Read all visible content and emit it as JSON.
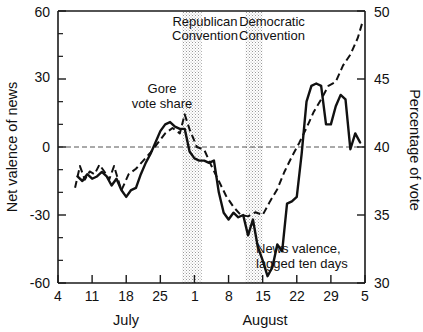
{
  "chart_data": {
    "type": "line",
    "title": "",
    "xlabel": "",
    "ylabel": "Net valence of news",
    "y2label": "Percentage of vote",
    "ylim": [
      -60,
      60
    ],
    "y2lim": [
      30,
      50
    ],
    "grid": false,
    "legend_position": "inline-annotations",
    "x_axis": {
      "tick_labels": [
        "4",
        "11",
        "18",
        "25",
        "1",
        "8",
        "15",
        "22",
        "29",
        "5"
      ],
      "month_labels": [
        "July",
        "August"
      ],
      "range_days": [
        0,
        63
      ],
      "tick_days": [
        0,
        7,
        14,
        21,
        28,
        35,
        42,
        49,
        56,
        63
      ]
    },
    "y_axis_left": {
      "tick_labels": [
        "60",
        "30",
        "0",
        "-30",
        "-60"
      ],
      "tick_values": [
        60,
        30,
        0,
        -30,
        -60
      ],
      "minor_tick_values": [
        50,
        40,
        20,
        10,
        -10,
        -20,
        -40,
        -50
      ]
    },
    "y_axis_right": {
      "tick_labels": [
        "50",
        "45",
        "40",
        "35",
        "30"
      ],
      "tick_values": [
        50,
        45,
        40,
        35,
        30
      ]
    },
    "zero_reference_line": 0,
    "shaded_bands": [
      {
        "label": "Republican Convention",
        "start_day": 25.5,
        "end_day": 29.5
      },
      {
        "label": "Democratic Convention",
        "start_day": 38.5,
        "end_day": 42.0
      }
    ],
    "annotations": [
      {
        "name": "gore-vote-share-label",
        "line1": "Gore",
        "line2": "vote share"
      },
      {
        "name": "news-valence-label",
        "line1": "News valence,",
        "line2": "lagged ten days"
      },
      {
        "name": "republican-convention-label",
        "line1": "Republican",
        "line2": "Convention"
      },
      {
        "name": "democratic-convention-label",
        "line1": "Democratic",
        "line2": "Convention"
      }
    ],
    "series": [
      {
        "name": "News valence, lagged ten days",
        "style": "solid",
        "axis": "left",
        "x": [
          4.0,
          5.0,
          6.0,
          7.0,
          8.0,
          9.0,
          10.0,
          11.0,
          12.0,
          13.0,
          14.0,
          15.0,
          16.0,
          17.0,
          18.0,
          19.0,
          20.0,
          21.0,
          22.0,
          23.0,
          24.0,
          25.0,
          26.0,
          27.0,
          28.0,
          29.0,
          30.0,
          31.0,
          32.0,
          33.0,
          34.0,
          35.0,
          36.0,
          37.0,
          38.0,
          39.0,
          40.0,
          41.0,
          42.0,
          43.0,
          44.0,
          45.0,
          46.0,
          47.0,
          48.0,
          49.0,
          50.0,
          51.0,
          52.0,
          53.0,
          54.0,
          55.0,
          56.0,
          57.0,
          58.0,
          59.0,
          60.0,
          61.0,
          62.0
        ],
        "y": [
          -13,
          -15,
          -12,
          -14,
          -13,
          -11,
          -13,
          -17,
          -14,
          -19,
          -22,
          -19,
          -18,
          -12,
          -7,
          -3,
          2,
          7,
          10,
          11,
          9,
          8,
          8,
          -2,
          -5,
          -6,
          -6,
          -7,
          -6,
          -20,
          -29,
          -32,
          -29,
          -31,
          -30,
          -39,
          -32,
          -44,
          -50,
          -57,
          -53,
          -43,
          -46,
          -25,
          -24,
          -22,
          -3,
          20,
          27,
          28,
          27,
          10,
          10,
          18,
          23,
          21,
          -1,
          6,
          2
        ]
      },
      {
        "name": "Gore vote share",
        "style": "dashed",
        "axis": "right",
        "x": [
          3.5,
          4.5,
          5.5,
          6.5,
          7.5,
          8.5,
          9.5,
          10.5,
          11.5,
          13,
          14.5,
          16,
          17.5,
          19,
          20.5,
          22,
          23.5,
          25,
          26,
          27,
          28.5,
          30,
          31.5,
          33,
          34.5,
          36,
          37.5,
          39,
          40.5,
          42,
          43.5,
          45,
          46.5,
          48,
          49.5,
          51,
          52.5,
          54,
          55.5,
          57,
          58.5,
          60,
          61.5,
          62.5
        ],
        "y": [
          37.0,
          38.6,
          37.6,
          38.2,
          38.0,
          38.7,
          38.2,
          37.6,
          38.6,
          36.8,
          38.0,
          38.4,
          39.0,
          39.6,
          40.3,
          41.0,
          41.4,
          41.0,
          42.4,
          41.3,
          40.0,
          39.8,
          38.6,
          37.5,
          36.4,
          35.6,
          35.0,
          34.9,
          35.2,
          35.0,
          36.0,
          36.9,
          38.2,
          39.3,
          40.3,
          41.4,
          42.6,
          43.5,
          44.5,
          44.8,
          46.0,
          46.8,
          48.0,
          49.2
        ]
      }
    ]
  },
  "labels": {
    "y_left_title": "Net valence of news",
    "y_right_title": "Percentage of vote",
    "month_july": "July",
    "month_august": "August",
    "gore_line1": "Gore",
    "gore_line2": "vote share",
    "news_line1": "News valence,",
    "news_line2": "lagged ten days",
    "rep_line1": "Republican",
    "rep_line2": "Convention",
    "dem_line1": "Democratic",
    "dem_line2": "Convention",
    "x_t0": "4",
    "x_t1": "11",
    "x_t2": "18",
    "x_t3": "25",
    "x_t4": "1",
    "x_t5": "8",
    "x_t6": "15",
    "x_t7": "22",
    "x_t8": "29",
    "x_t9": "5",
    "yl_t0": "60",
    "yl_t1": "30",
    "yl_t2": "0",
    "yl_t3": "-30",
    "yl_t4": "-60",
    "yr_t0": "50",
    "yr_t1": "45",
    "yr_t2": "40",
    "yr_t3": "35",
    "yr_t4": "30"
  },
  "colors": {
    "ink": "#111111",
    "band": "#cfcfcf",
    "background": "#ffffff"
  }
}
